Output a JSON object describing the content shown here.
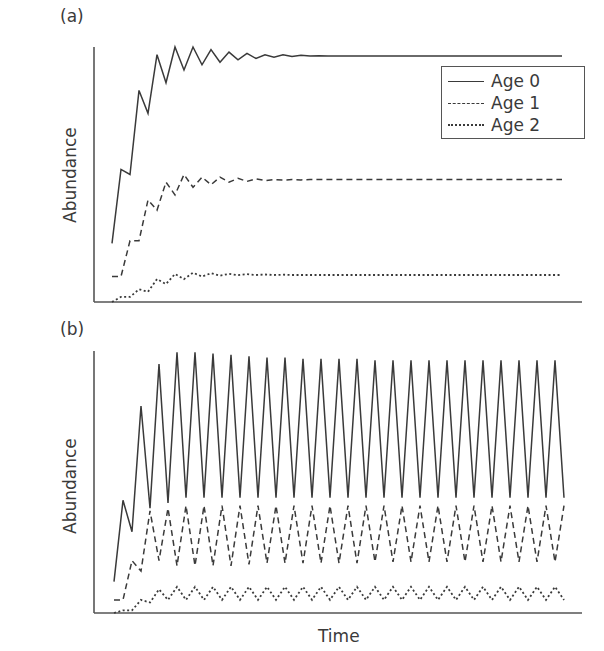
{
  "figure": {
    "xlabel": "Time",
    "legend": [
      {
        "label": "Age 0",
        "style": "solid"
      },
      {
        "label": "Age 1",
        "style": "dashed"
      },
      {
        "label": "Age 2",
        "style": "dotted"
      }
    ],
    "line_color": "#3a3a3a",
    "axis_color": "#555555"
  },
  "chart_data": [
    {
      "type": "line",
      "panel": "(a)",
      "title": "(a)",
      "xlabel": "",
      "ylabel": "Abundance",
      "ylim": [
        0,
        100
      ],
      "grid": false,
      "legend_position": "upper right",
      "x": "time steps 0..50",
      "series": [
        {
          "name": "Age 0",
          "style": "solid",
          "values": [
            23,
            52,
            50,
            83,
            74,
            97,
            86,
            100,
            91,
            100,
            93,
            99,
            94,
            98,
            95,
            97.5,
            95.5,
            97,
            96,
            97,
            96.3,
            96.8,
            96.5,
            96.6,
            96.5,
            96.5,
            96.5,
            96.5,
            96.5,
            96.5,
            96.5,
            96.5,
            96.5,
            96.5,
            96.5,
            96.5,
            96.5,
            96.5,
            96.5,
            96.5,
            96.5,
            96.5,
            96.5,
            96.5,
            96.5,
            96.5,
            96.5,
            96.5,
            96.5,
            96.5,
            96.5
          ]
        },
        {
          "name": "Age 1",
          "style": "dashed",
          "values": [
            10,
            10,
            24,
            24,
            40,
            36,
            47,
            42,
            50,
            45,
            49,
            46,
            49,
            47,
            48.5,
            47.3,
            48.3,
            47.6,
            48,
            47.8,
            48,
            47.9,
            48,
            48,
            48,
            48,
            48,
            48,
            48,
            48,
            48,
            48,
            48,
            48,
            48,
            48,
            48,
            48,
            48,
            48,
            48,
            48,
            48,
            48,
            48,
            48,
            48,
            48,
            48,
            48,
            48
          ]
        },
        {
          "name": "Age 2",
          "style": "dotted",
          "values": [
            0,
            2,
            2,
            5,
            4,
            9,
            7,
            11,
            9,
            11.5,
            10,
            11.3,
            10.3,
            11,
            10.5,
            10.9,
            10.6,
            10.8,
            10.6,
            10.7,
            10.6,
            10.6,
            10.6,
            10.6,
            10.6,
            10.6,
            10.6,
            10.6,
            10.6,
            10.6,
            10.6,
            10.6,
            10.6,
            10.6,
            10.6,
            10.6,
            10.6,
            10.6,
            10.6,
            10.6,
            10.6,
            10.6,
            10.6,
            10.6,
            10.6,
            10.6,
            10.6,
            10.6,
            10.6,
            10.6,
            10.6
          ]
        }
      ]
    },
    {
      "type": "line",
      "panel": "(b)",
      "title": "(b)",
      "xlabel": "Time",
      "ylabel": "Abundance",
      "ylim": [
        0,
        100
      ],
      "grid": false,
      "x": "time steps 0..50",
      "series": [
        {
          "name": "Age 0",
          "style": "solid",
          "values": [
            12,
            43,
            31,
            79,
            40,
            95,
            42,
            99.5,
            44,
            99.5,
            44,
            99,
            44,
            98.5,
            44,
            98,
            44,
            97.5,
            44,
            97.5,
            44,
            97,
            44,
            97,
            44,
            97,
            44,
            97,
            44,
            96.5,
            44,
            96.5,
            44,
            96.5,
            44,
            96.5,
            44,
            96.5,
            44,
            96.5,
            44,
            96.5,
            44,
            96.5,
            44,
            96.5,
            44,
            96.5,
            44,
            96.5,
            44
          ]
        },
        {
          "name": "Age 1",
          "style": "dashed",
          "values": [
            5,
            5,
            20,
            16,
            39,
            20,
            40,
            18,
            41,
            18,
            41,
            18,
            41,
            18,
            41,
            18.5,
            41,
            19,
            41,
            19,
            41,
            19,
            41,
            19,
            41,
            19,
            41,
            19,
            41,
            19.5,
            41,
            19.5,
            41,
            19.5,
            41,
            19.5,
            41,
            19.5,
            41,
            19.5,
            41,
            19.5,
            41,
            19.5,
            41,
            19.5,
            41,
            19.5,
            41,
            19.5,
            41
          ]
        },
        {
          "name": "Age 2",
          "style": "dotted",
          "values": [
            0,
            1,
            1,
            5,
            4,
            9,
            5,
            10,
            5,
            10,
            5,
            10,
            5,
            10,
            5,
            10,
            5,
            10,
            5,
            10,
            5,
            10,
            5,
            10,
            5,
            10,
            5,
            10,
            5,
            10,
            5,
            10,
            5,
            10,
            5,
            10,
            5,
            10,
            5,
            10,
            5,
            10,
            5,
            10,
            5,
            10,
            5,
            10,
            5,
            10,
            5
          ]
        }
      ]
    }
  ]
}
